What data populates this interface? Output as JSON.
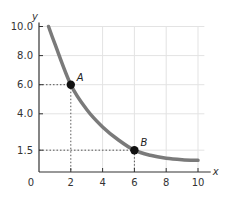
{
  "chart_data": {
    "type": "line",
    "title": "",
    "xlabel": "x",
    "ylabel": "y",
    "xlim": [
      0,
      10
    ],
    "ylim": [
      0,
      10
    ],
    "grid": true,
    "x_ticks": [
      "0",
      "2",
      "4",
      "6",
      "8",
      "10"
    ],
    "y_ticks": [
      "10.0",
      "8.0",
      "6.0",
      "4.0",
      "1.5"
    ],
    "series": [
      {
        "name": "curve",
        "color": "#7a7a7a",
        "x": [
          0.6,
          1.0,
          2.0,
          3.0,
          4.0,
          5.0,
          6.0,
          7.0,
          8.0,
          9.0,
          10.0
        ],
        "y": [
          10.0,
          8.8,
          6.0,
          4.3,
          3.1,
          2.2,
          1.5,
          1.15,
          0.95,
          0.85,
          0.8
        ]
      }
    ],
    "points": [
      {
        "label": "A",
        "x": 2,
        "y": 6.0
      },
      {
        "label": "B",
        "x": 6,
        "y": 1.5
      }
    ],
    "annotations": [
      "dotted guide lines from A to x=2 and y=6.0",
      "dotted guide lines from B to x=6 and y=1.5"
    ]
  },
  "colors": {
    "curve": "#7a7a7a",
    "axis": "#333333",
    "grid": "#e3e3e3",
    "point": "#111111"
  }
}
